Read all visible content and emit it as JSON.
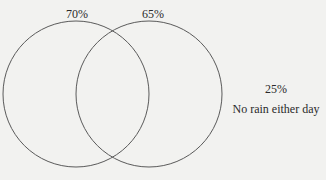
{
  "diagram": {
    "type": "venn",
    "sets": [
      {
        "label": "70%",
        "value": 70
      },
      {
        "label": "65%",
        "value": 65
      }
    ],
    "outside": {
      "percent": "25%",
      "caption": "No rain either day"
    },
    "stroke_color": "#555555",
    "background": "#f2f2f0"
  }
}
